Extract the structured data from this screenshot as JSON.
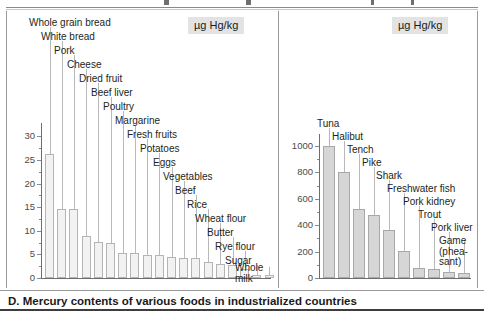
{
  "caption": "D. Mercury contents of various foods in industrialized countries",
  "unit_label": "µg Hg/kg",
  "chart_data": [
    {
      "type": "bar",
      "title": "Mercury contents of various foods (non-fish)",
      "xlabel": "",
      "ylabel": "µg Hg/kg",
      "ylim": [
        0,
        32
      ],
      "yticks": [
        0,
        5,
        10,
        15,
        20,
        25,
        30
      ],
      "ytick_labels": [
        "0",
        "5",
        "10",
        "15",
        "20",
        "25",
        "30"
      ],
      "grid": false,
      "legend": "none",
      "categories": [
        "Whole grain bread",
        "White bread",
        "Pork",
        "Cheese",
        "Dried fruit",
        "Beef liver",
        "Poultry",
        "Margarine",
        "Fresh fruits",
        "Potatoes",
        "Eggs",
        "Vegetables",
        "Beef",
        "Rice",
        "Wheat flour",
        "Butter",
        "Rye flour",
        "Sugar",
        "Whole milk"
      ],
      "values": [
        26.2,
        14.7,
        14.7,
        8.9,
        7.6,
        7.4,
        5.3,
        5.3,
        4.8,
        4.8,
        4.4,
        4.3,
        4.3,
        3.3,
        2.9,
        2.7,
        1.9,
        0.7,
        0.6
      ]
    },
    {
      "type": "bar",
      "title": "Mercury contents of fish, offal and game",
      "xlabel": "",
      "ylabel": "µg Hg/kg",
      "ylim": [
        0,
        1060
      ],
      "yticks": [
        0,
        200,
        400,
        600,
        800,
        1000
      ],
      "ytick_labels": [
        "0",
        "200",
        "400",
        "600",
        "800",
        "1000"
      ],
      "grid": false,
      "legend": "none",
      "categories": [
        "Tuna",
        "Halibut",
        "Tench",
        "Pike",
        "Shark",
        "Freshwater fish",
        "Pork kidney",
        "Trout",
        "Pork liver",
        "Game (pheasant)"
      ],
      "values": [
        1000,
        800,
        520,
        480,
        365,
        205,
        75,
        70,
        48,
        35
      ]
    }
  ],
  "left_panel": {
    "unit": "µg Hg/kg",
    "ytick_labels": [
      "30",
      "25",
      "20",
      "15",
      "10",
      "5",
      "0"
    ],
    "callouts": [
      "Whole grain bread",
      "White bread",
      "Pork",
      "Cheese",
      "Dried fruit",
      "Beef liver",
      "Poultry",
      "Margarine",
      "Fresh fruits",
      "Potatoes",
      "Eggs",
      "Vegetables",
      "Beef",
      "Rice",
      "Wheat flour",
      "Butter",
      "Rye flour",
      "Sugar",
      "Whole milk"
    ]
  },
  "right_panel": {
    "unit": "µg Hg/kg",
    "ytick_labels": [
      "1000",
      "800",
      "600",
      "400",
      "200",
      "0"
    ],
    "callouts": [
      "Tuna",
      "Halibut",
      "Tench",
      "Pike",
      "Shark",
      "Freshwater fish",
      "Pork kidney",
      "Trout",
      "Pork liver",
      "Game (phea- sant)"
    ]
  }
}
